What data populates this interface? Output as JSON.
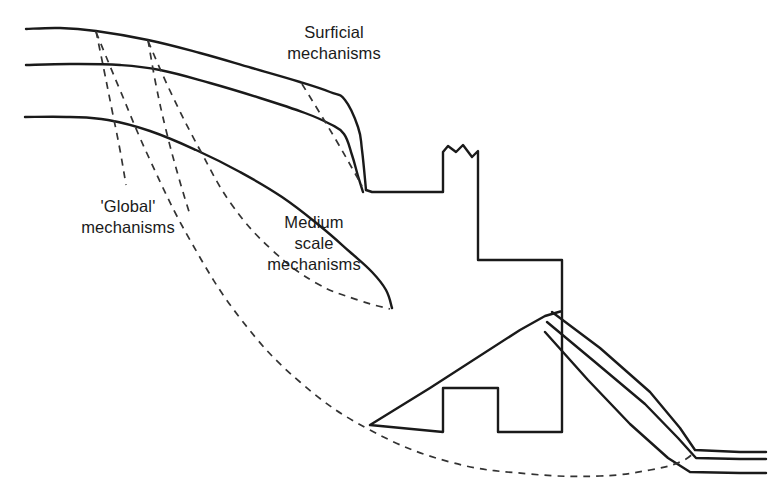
{
  "figure": {
    "kind": "geotechnical-slope-stability-diagram",
    "background_color": "#ffffff",
    "line_color": "#1a1a1a",
    "dashed_color": "#333333"
  },
  "labels": {
    "surficial": {
      "name": "surficial-mechanisms-label",
      "line1": "Surficial",
      "line2": "mechanisms"
    },
    "global": {
      "name": "global-mechanisms-label",
      "line1": "'Global'",
      "line2": "mechanisms"
    },
    "medium": {
      "name": "medium-scale-mechanisms-label",
      "line1": "Medium",
      "line2": "scale",
      "line3": "mechanisms"
    }
  },
  "chart_data": {
    "type": "line",
    "title": "",
    "xlabel": "",
    "ylabel": "",
    "grid": false,
    "legend": "none",
    "xlim": [
      0,
      769
    ],
    "ylim": [
      502,
      0
    ],
    "annotations": [
      {
        "text": "Surficial mechanisms",
        "x": 334,
        "y": 45
      },
      {
        "text": "'Global' mechanisms",
        "x": 128,
        "y": 220
      },
      {
        "text": "Medium scale mechanisms",
        "x": 314,
        "y": 250
      }
    ],
    "series": [
      {
        "name": "upper-ground-surface",
        "style": "solid",
        "points": [
          [
            26,
            29
          ],
          [
            60,
            28
          ],
          [
            96,
            31
          ],
          [
            148,
            40
          ],
          [
            200,
            53
          ],
          [
            252,
            68
          ],
          [
            300,
            82
          ],
          [
            330,
            92
          ],
          [
            345,
            100
          ],
          [
            358,
            127
          ],
          [
            362,
            150
          ],
          [
            366,
            190
          ]
        ]
      },
      {
        "name": "middle-ground-surface",
        "style": "solid",
        "points": [
          [
            26,
            65
          ],
          [
            70,
            64
          ],
          [
            120,
            65
          ],
          [
            160,
            70
          ],
          [
            210,
            83
          ],
          [
            260,
            98
          ],
          [
            305,
            113
          ],
          [
            330,
            124
          ],
          [
            344,
            134
          ],
          [
            352,
            155
          ],
          [
            358,
            176
          ],
          [
            363,
            192
          ]
        ]
      },
      {
        "name": "lower-ground-surface",
        "style": "solid",
        "points": [
          [
            25,
            117
          ],
          [
            70,
            117
          ],
          [
            108,
            120
          ],
          [
            150,
            131
          ],
          [
            196,
            150
          ],
          [
            240,
            172
          ],
          [
            282,
            197
          ],
          [
            320,
            226
          ],
          [
            350,
            252
          ],
          [
            372,
            272
          ],
          [
            386,
            290
          ],
          [
            392,
            308
          ]
        ]
      },
      {
        "name": "surficial-slip-1",
        "style": "dashed",
        "points": [
          [
            96,
            31
          ],
          [
            104,
            70
          ],
          [
            112,
            110
          ],
          [
            120,
            150
          ],
          [
            126,
            185
          ]
        ]
      },
      {
        "name": "surficial-slip-2",
        "style": "dashed",
        "points": [
          [
            148,
            40
          ],
          [
            156,
            85
          ],
          [
            166,
            130
          ],
          [
            178,
            175
          ],
          [
            190,
            215
          ]
        ]
      },
      {
        "name": "surficial-slip-upper-right",
        "style": "dashed",
        "points": [
          [
            302,
            84
          ],
          [
            318,
            110
          ],
          [
            336,
            140
          ],
          [
            352,
            168
          ],
          [
            362,
            186
          ]
        ]
      },
      {
        "name": "medium-scale-slip",
        "style": "dashed",
        "points": [
          [
            148,
            41
          ],
          [
            172,
            95
          ],
          [
            200,
            150
          ],
          [
            232,
            205
          ],
          [
            272,
            250
          ],
          [
            316,
            283
          ],
          [
            358,
            300
          ],
          [
            390,
            309
          ]
        ]
      },
      {
        "name": "global-slip",
        "style": "dashed",
        "points": [
          [
            96,
            32
          ],
          [
            120,
            90
          ],
          [
            150,
            160
          ],
          [
            190,
            240
          ],
          [
            240,
            318
          ],
          [
            300,
            382
          ],
          [
            370,
            430
          ],
          [
            450,
            462
          ],
          [
            530,
            474
          ],
          [
            600,
            476
          ],
          [
            650,
            470
          ],
          [
            680,
            462
          ],
          [
            695,
            452
          ]
        ]
      },
      {
        "name": "excavation-bench-profile",
        "style": "solid",
        "points": [
          [
            366,
            190
          ],
          [
            372,
            192
          ],
          [
            443,
            192
          ],
          [
            443,
            152
          ],
          [
            448,
            146
          ],
          [
            456,
            152
          ],
          [
            463,
            145
          ],
          [
            472,
            157
          ],
          [
            478,
            151
          ],
          [
            478,
            260
          ],
          [
            562,
            260
          ],
          [
            562,
            311
          ],
          [
            545,
            316
          ],
          [
            520,
            330
          ],
          [
            430,
            388
          ],
          [
            370,
            425
          ],
          [
            443,
            432
          ],
          [
            443,
            388
          ],
          [
            498,
            388
          ],
          [
            498,
            432
          ],
          [
            562,
            432
          ],
          [
            562,
            311
          ]
        ]
      },
      {
        "name": "right-slope-upper",
        "style": "solid",
        "points": [
          [
            552,
            312
          ],
          [
            600,
            348
          ],
          [
            650,
            392
          ],
          [
            680,
            428
          ],
          [
            695,
            450
          ],
          [
            740,
            452
          ],
          [
            766,
            452
          ]
        ]
      },
      {
        "name": "right-slope-middle",
        "style": "solid",
        "points": [
          [
            547,
            322
          ],
          [
            595,
            362
          ],
          [
            645,
            404
          ],
          [
            678,
            438
          ],
          [
            696,
            458
          ],
          [
            740,
            459
          ],
          [
            766,
            459
          ]
        ]
      },
      {
        "name": "right-slope-lower",
        "style": "solid",
        "points": [
          [
            545,
            332
          ],
          [
            588,
            380
          ],
          [
            630,
            424
          ],
          [
            668,
            458
          ],
          [
            690,
            472
          ],
          [
            740,
            473
          ],
          [
            766,
            473
          ]
        ]
      }
    ]
  }
}
